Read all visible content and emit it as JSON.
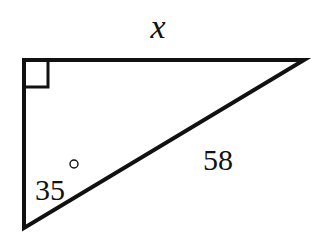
{
  "diagram": {
    "type": "right-triangle",
    "stroke_color": "#111111",
    "background": "#ffffff",
    "vertices": {
      "right_angle": [
        24,
        60
      ],
      "top_right": [
        304,
        60
      ],
      "bottom": [
        24,
        228
      ]
    },
    "labels": {
      "top_side": "x",
      "hypotenuse": "58",
      "angle_value": "35",
      "angle_unit": "°"
    },
    "right_angle_marker": true
  }
}
